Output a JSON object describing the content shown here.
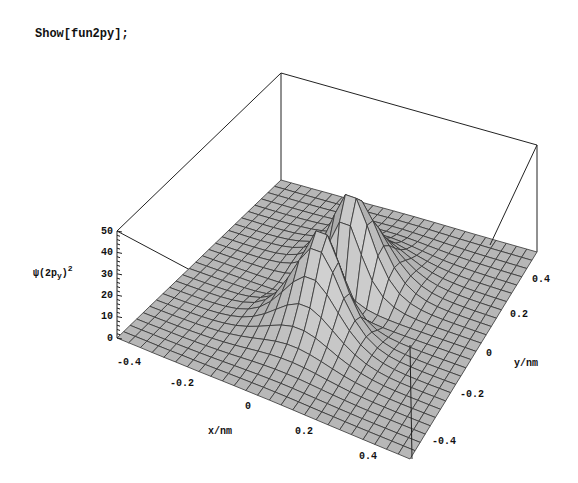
{
  "notebook": {
    "input_command": "Show[fun2py];"
  },
  "chart_data": {
    "type": "surface3d",
    "title": "",
    "function": "psi(2p_y)^2",
    "xlabel": "x/nm",
    "ylabel": "y/nm",
    "zlabel": "ψ(2p_y)²",
    "zlabel_parts": {
      "psi": "ψ",
      "open": "(2p",
      "sub": "y",
      "close": ")",
      "sup": "2"
    },
    "x_ticks": [
      "-0.4",
      "-0.2",
      "0",
      "0.2",
      "0.4"
    ],
    "y_ticks": [
      "-0.4",
      "-0.2",
      "0",
      "0.2",
      "0.4"
    ],
    "z_ticks": [
      "0",
      "10",
      "20",
      "30",
      "40",
      "50"
    ],
    "xlim": [
      -0.5,
      0.5
    ],
    "ylim": [
      -0.5,
      0.5
    ],
    "zlim": [
      0,
      50
    ],
    "grid_resolution": 25,
    "peak_value": 45,
    "lobes": [
      {
        "x": 0.0,
        "y": 0.1,
        "height": 45
      },
      {
        "x": 0.0,
        "y": -0.1,
        "height": 45
      }
    ],
    "box": true,
    "surface_color": "#c8c8c8",
    "mesh_color": "#333333"
  }
}
